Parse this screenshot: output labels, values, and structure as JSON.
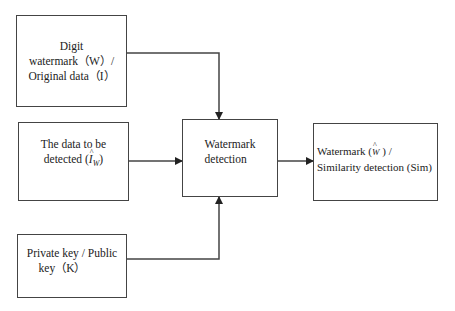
{
  "diagram": {
    "type": "flowchart",
    "nodes": [
      {
        "id": "input-watermark",
        "lines": [
          "Digit",
          "watermark（W）/",
          "Original data（I）"
        ]
      },
      {
        "id": "data-to-detect",
        "lines": [
          "The data to be",
          "detected"
        ],
        "symbol": "I",
        "symbol_sub": "W"
      },
      {
        "id": "key",
        "lines": [
          "Private key / Public",
          "key（K）"
        ]
      },
      {
        "id": "detection",
        "lines": [
          "Watermark",
          "detection"
        ]
      },
      {
        "id": "output",
        "line1_prefix": "Watermark (",
        "symbol": "W",
        "line1_suffix": " ) /",
        "line2": "Similarity detection (Sim)"
      }
    ],
    "edges": [
      {
        "from": "input-watermark",
        "to": "detection"
      },
      {
        "from": "data-to-detect",
        "to": "detection"
      },
      {
        "from": "key",
        "to": "detection"
      },
      {
        "from": "detection",
        "to": "output"
      }
    ],
    "colors": {
      "stroke": "#444444",
      "background": "#ffffff",
      "text": "#222222"
    }
  }
}
